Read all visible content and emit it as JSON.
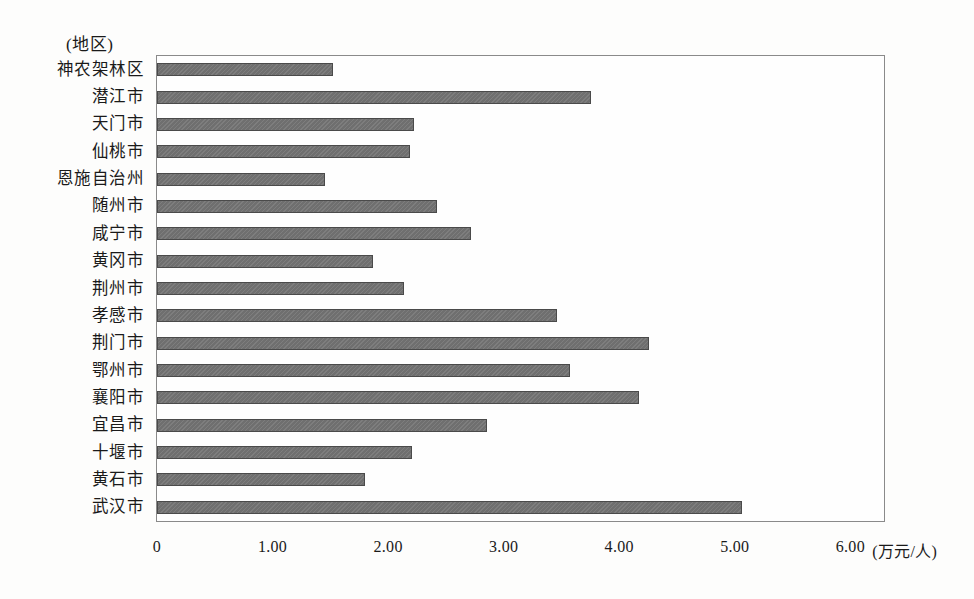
{
  "chart_data": {
    "type": "bar",
    "orientation": "horizontal",
    "title": "",
    "subtitle": "",
    "axis_caption": "(地区)",
    "xlabel": "(万元/人)",
    "ylabel": "",
    "xlim": [
      0,
      6.3
    ],
    "xticks": [
      "0",
      "1.00",
      "2.00",
      "3.00",
      "4.00",
      "5.00",
      "6.00"
    ],
    "xtick_values": [
      0,
      1,
      2,
      3,
      4,
      5,
      6
    ],
    "unit_label": "(万元/人)",
    "grid": false,
    "legend": false,
    "bar_color": "#6f6f6f",
    "bar_edge_color": "#4a4a4a",
    "frame_color": "#8a8a8a",
    "categories": [
      "神农架林区",
      "潜江市",
      "天门市",
      "仙桃市",
      "恩施自治州",
      "随州市",
      "咸宁市",
      "黄冈市",
      "荆州市",
      "孝感市",
      "荆门市",
      "鄂州市",
      "襄阳市",
      "宜昌市",
      "十堰市",
      "黄石市",
      "武汉市"
    ],
    "values": [
      1.52,
      3.76,
      2.22,
      2.19,
      1.45,
      2.42,
      2.72,
      1.87,
      2.14,
      3.46,
      4.26,
      3.57,
      4.17,
      2.86,
      2.21,
      1.8,
      5.06
    ]
  }
}
